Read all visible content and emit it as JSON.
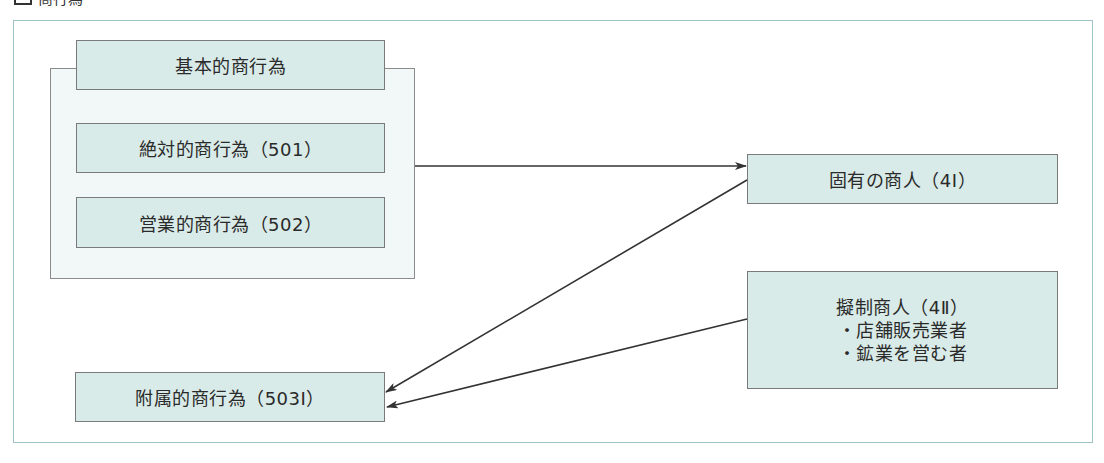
{
  "heading": {
    "title": "商行為",
    "icon": "square-box-icon"
  },
  "diagram": {
    "group": {
      "title": "基本的商行為",
      "items": [
        "絶対的商行為（501）",
        "営業的商行為（502）"
      ]
    },
    "merchant_inherent": "固有の商人（4Ⅰ）",
    "merchant_deemed": {
      "title": "擬制商人（4Ⅱ）",
      "items": [
        "・店舗販売業者",
        "・鉱業を営む者"
      ]
    },
    "ancillary": "附属的商行為（503Ⅰ）",
    "edges": [
      {
        "from": "基本的商行為",
        "to": "固有の商人（4Ⅰ）"
      },
      {
        "from": "固有の商人（4Ⅰ）",
        "to": "附属的商行為（503Ⅰ）"
      },
      {
        "from": "擬制商人（4Ⅱ）",
        "to": "附属的商行為（503Ⅰ）"
      }
    ]
  },
  "colors": {
    "box_fill": "#d9ebe8",
    "container_fill": "#f2f8f7",
    "frame_border": "#9fc3c6",
    "arrow": "#333333"
  }
}
